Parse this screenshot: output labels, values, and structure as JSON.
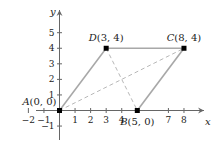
{
  "axes": {
    "x_label": "x",
    "y_label": "y",
    "x_range": [
      -2,
      8.5
    ],
    "y_range": [
      -1.5,
      6.3
    ],
    "x_ticks": [
      {
        "value": -2,
        "label": "−2"
      },
      {
        "value": -1,
        "label": "−1"
      },
      {
        "value": 1,
        "label": "1"
      },
      {
        "value": 2,
        "label": "2"
      },
      {
        "value": 3,
        "label": "3"
      },
      {
        "value": 4,
        "label": "4"
      },
      {
        "value": 5,
        "label": ""
      },
      {
        "value": 7,
        "label": "7"
      },
      {
        "value": 8,
        "label": "8"
      }
    ],
    "y_ticks": [
      {
        "value": -1,
        "label": "−1"
      },
      {
        "value": 1,
        "label": "1"
      },
      {
        "value": 2,
        "label": "2"
      },
      {
        "value": 3,
        "label": "3"
      },
      {
        "value": 4,
        "label": "4"
      },
      {
        "value": 5,
        "label": "5"
      }
    ]
  },
  "points": [
    {
      "name": "A",
      "label": "A(0, 0)",
      "x": 0,
      "y": 0
    },
    {
      "name": "B",
      "label": "B(5, 0)",
      "x": 5,
      "y": 0
    },
    {
      "name": "C",
      "label": "C(8, 4)",
      "x": 8,
      "y": 4
    },
    {
      "name": "D",
      "label": "D(3, 4)",
      "x": 3,
      "y": 4
    }
  ],
  "sides": [
    [
      "A",
      "D"
    ],
    [
      "D",
      "C"
    ],
    [
      "C",
      "B"
    ]
  ],
  "diagonals": [
    [
      "A",
      "C"
    ],
    [
      "D",
      "B"
    ]
  ],
  "colors": {
    "side": "#a8a8a8",
    "diagonal": "#b8b8b8",
    "point": "#000000",
    "axis": "#666666"
  }
}
